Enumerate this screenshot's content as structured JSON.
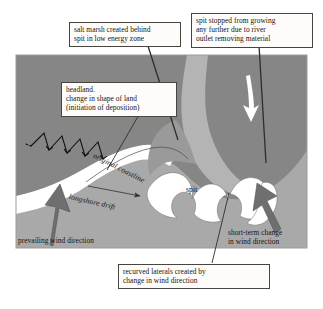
{
  "diagram": {
    "type": "coastal-geomorphology-diagram",
    "colors": {
      "land": "#868686",
      "sea": "#a9a9a9",
      "beach": "#ffffff",
      "spit": "#ffffff",
      "salt_marsh": "#9a9a9a",
      "estuary": "#b4b4b4",
      "outline": "#3b3b3b",
      "arrow_fill": "#6f6f6f",
      "callout_border": "#4a443e",
      "callout_background": "#fdfcfa",
      "text": "#17140f"
    },
    "callouts": [
      {
        "id": "salt-marsh",
        "text": "salt marsh created behind\nspit in low energy zone"
      },
      {
        "id": "river-outlet",
        "text": "spit stopped from growing\nany further due to river\noutlet removing material"
      },
      {
        "id": "headland",
        "text": "headland.\nchange in shape of land\n(initiation of deposition)"
      },
      {
        "id": "recurved-laterals",
        "text": "recurved laterals created by\nchange in wind direction"
      }
    ],
    "labels": {
      "prevailing_wind": "prevailing wind direction",
      "short_term_wind": "short-term change\nin wind direction",
      "original_coastline": "original coastline",
      "longshore_drift": "longshore drift",
      "spit": "spit"
    },
    "arrows": [
      {
        "id": "prevailing-wind-arrow",
        "direction": "north-north-east",
        "style": "thick-grey"
      },
      {
        "id": "short-term-wind-arrow",
        "direction": "north-north-west",
        "style": "thick-grey"
      },
      {
        "id": "longshore-drift-arrow",
        "direction": "east",
        "style": "thin-line"
      },
      {
        "id": "river-flow-arrow",
        "direction": "south-south-east",
        "style": "white"
      },
      {
        "id": "swash-backwash-zigzag",
        "direction": "along-beach",
        "style": "zigzag-black"
      }
    ]
  }
}
